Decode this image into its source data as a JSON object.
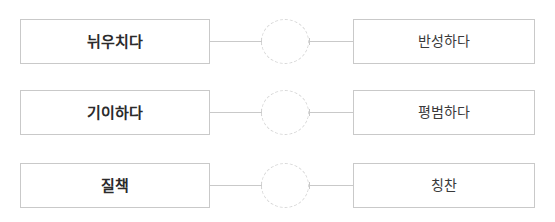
{
  "worksheet": {
    "type": "matching-exercise",
    "background_color": "#ffffff",
    "border_color": "#c9c9c9",
    "circle_border_color": "#d8d8d8",
    "text_color": "#2b2b2b",
    "rows": [
      {
        "left_term": "뉘우치다",
        "right_term": "반성하다",
        "circle_label": ""
      },
      {
        "left_term": "기이하다",
        "right_term": "평범하다",
        "circle_label": ""
      },
      {
        "left_term": "질책",
        "right_term": "칭찬",
        "circle_label": ""
      }
    ]
  }
}
